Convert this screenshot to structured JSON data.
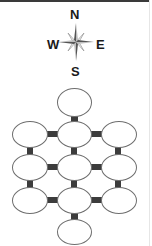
{
  "compass": {
    "north": "N",
    "south": "S",
    "east": "E",
    "west": "W"
  },
  "colors": {
    "room_border": "#6e6e6e",
    "corridor": "#3c3c3c",
    "compass_dark": "#555555",
    "compass_light": "#bdbdbd"
  },
  "rooms": [
    {
      "id": "top",
      "row": 0,
      "col": 1
    },
    {
      "id": "r1-left",
      "row": 1,
      "col": 0
    },
    {
      "id": "r1-center",
      "row": 1,
      "col": 1
    },
    {
      "id": "r1-right",
      "row": 1,
      "col": 2
    },
    {
      "id": "r2-left",
      "row": 2,
      "col": 0
    },
    {
      "id": "r2-center",
      "row": 2,
      "col": 1
    },
    {
      "id": "r2-right",
      "row": 2,
      "col": 2
    },
    {
      "id": "r3-left",
      "row": 3,
      "col": 0
    },
    {
      "id": "r3-center",
      "row": 3,
      "col": 1
    },
    {
      "id": "r3-right",
      "row": 3,
      "col": 2
    },
    {
      "id": "bottom",
      "row": 4,
      "col": 1
    }
  ]
}
